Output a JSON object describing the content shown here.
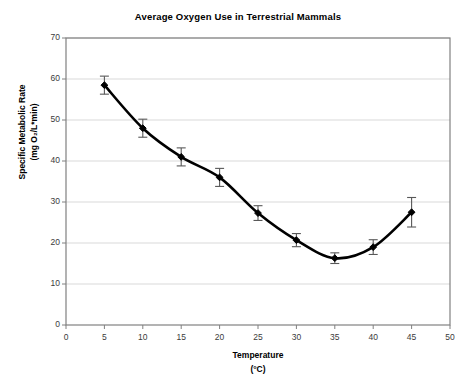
{
  "chart_data": {
    "type": "line",
    "title": "Average Oxygen Use in Terrestrial Mammals",
    "xlabel": "Temperature",
    "xlabel_units": "(°C)",
    "ylabel": "Specific Metabolic Rate",
    "ylabel_units": "(mg O₂/L*min)",
    "x": [
      5,
      10,
      15,
      20,
      25,
      30,
      35,
      40,
      45
    ],
    "values": [
      58.5,
      48.0,
      41.0,
      36.0,
      27.3,
      20.7,
      16.3,
      19.0,
      27.5
    ],
    "error": [
      2.2,
      2.2,
      2.2,
      2.2,
      1.8,
      1.6,
      1.3,
      1.8,
      3.6
    ],
    "xlim": [
      0,
      50
    ],
    "ylim": [
      0,
      70
    ],
    "xticks": [
      "0",
      "5",
      "10",
      "15",
      "20",
      "25",
      "30",
      "35",
      "40",
      "45",
      "50"
    ],
    "yticks": [
      "0",
      "10",
      "20",
      "30",
      "40",
      "50",
      "60",
      "70"
    ],
    "grid": "horizontal",
    "legend": "none",
    "series_name": "Average oxygen use",
    "marker": "filled-diamond",
    "line_color": "#000000",
    "grid_color": "#d9d9d9",
    "border_color": "#808080",
    "plot_background": "#ffffff"
  }
}
